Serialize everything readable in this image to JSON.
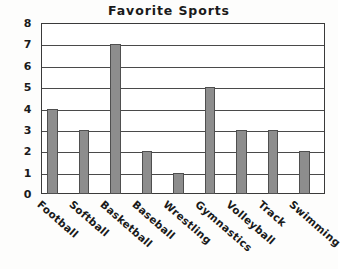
{
  "chart_data": {
    "type": "bar",
    "title": "Favorite Sports",
    "xlabel": "",
    "ylabel": "",
    "categories": [
      "Football",
      "Softball",
      "Basketball",
      "Baseball",
      "Wrestling",
      "Gymnastics",
      "Volleyball",
      "Track",
      "Swimming"
    ],
    "values": [
      4,
      3,
      7,
      2,
      1,
      5,
      3,
      3,
      2
    ],
    "ylim": [
      0,
      8
    ],
    "yticks": [
      0,
      1,
      2,
      3,
      4,
      5,
      6,
      7,
      8
    ],
    "ytick_labels": [
      "0",
      "1",
      "2",
      "3",
      "4",
      "5",
      "6",
      "7",
      "8"
    ],
    "grid": true,
    "legend": false,
    "bar_color": "#8d8d8d",
    "bar_edge_color": "#4f4f4f",
    "axis_color": "#3a3a3a",
    "background_color": "#ffffff"
  }
}
